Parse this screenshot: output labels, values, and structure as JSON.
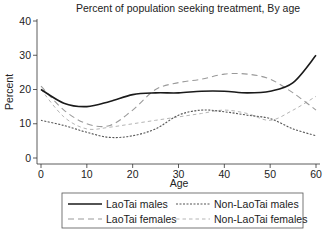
{
  "chart_data": {
    "type": "line",
    "title": "Percent of population seeking treatment, By age",
    "xlabel": "Age",
    "ylabel": "Percent",
    "xlim": [
      0,
      60
    ],
    "ylim": [
      0,
      40
    ],
    "xticks": [
      0,
      10,
      20,
      30,
      40,
      50,
      60
    ],
    "yticks": [
      0,
      10,
      20,
      30,
      40
    ],
    "grid": false,
    "legend_position": "bottom",
    "x": [
      0,
      5,
      10,
      15,
      20,
      25,
      30,
      35,
      40,
      45,
      50,
      55,
      60
    ],
    "series": [
      {
        "name": "LaoTai males",
        "style": "solid",
        "color": "#1a1a1a",
        "width": 1.6,
        "values": [
          20,
          16,
          15,
          16.5,
          18.5,
          19,
          19,
          19.5,
          19.5,
          19,
          19.5,
          22,
          30
        ]
      },
      {
        "name": "LaoTai females",
        "style": "long-dash",
        "color": "#9a9a9a",
        "width": 1.1,
        "values": [
          21,
          14,
          10,
          9.5,
          14,
          20,
          22,
          23,
          24.5,
          24.5,
          23,
          19,
          14
        ]
      },
      {
        "name": "Non-LaoTai males",
        "style": "short-dash",
        "color": "#555555",
        "width": 1.1,
        "values": [
          11,
          9.5,
          7.5,
          6,
          6.5,
          8.5,
          12.5,
          14,
          13.5,
          12.5,
          11.5,
          8.5,
          6.5
        ]
      },
      {
        "name": "Non-LaoTai females",
        "style": "medium-dash",
        "color": "#b5b5b5",
        "width": 1.0,
        "values": [
          20,
          12,
          8.5,
          9,
          10,
          11,
          12,
          13,
          14,
          13,
          11,
          14,
          18
        ]
      }
    ]
  },
  "title": "Percent of population seeking treatment, By age",
  "axes": {
    "xlabel": "Age",
    "ylabel": "Percent",
    "xtick_labels": [
      "0",
      "10",
      "20",
      "30",
      "40",
      "50",
      "60"
    ],
    "ytick_labels": [
      "0",
      "10",
      "20",
      "30",
      "40"
    ]
  },
  "legend": {
    "items": [
      "LaoTai males",
      "Non-LaoTai males",
      "LaoTai females",
      "Non-LaoTai females"
    ]
  }
}
